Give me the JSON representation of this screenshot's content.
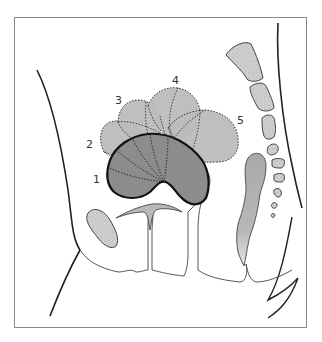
{
  "figure": {
    "type": "sagittal-pelvis-schematic",
    "labels": [
      {
        "id": "1",
        "text": "1"
      },
      {
        "id": "2",
        "text": "2"
      },
      {
        "id": "3",
        "text": "3"
      },
      {
        "id": "4",
        "text": "4"
      },
      {
        "id": "5",
        "text": "5"
      }
    ],
    "colors": {
      "background": "#ffffff",
      "frame": "#8a8a8a",
      "outline": "#222222",
      "lobe_fill": "#b9b9b9",
      "main_fill": "#8c8c8c",
      "bone_fill": "#c8c8c8",
      "rectum_fill": "#b3b3b3"
    }
  }
}
